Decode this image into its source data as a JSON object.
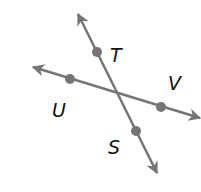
{
  "diagram": {
    "line_color": "#757575",
    "label_color": "#111111",
    "lines": [
      {
        "name": "line-TS",
        "from": [
          78,
          14
        ],
        "to": [
          157,
          173
        ]
      },
      {
        "name": "line-UV",
        "from": [
          33,
          67
        ],
        "to": [
          200,
          118
        ]
      }
    ],
    "points": [
      {
        "label": "T",
        "x": 97,
        "y": 52,
        "lx": 110,
        "ly": 62
      },
      {
        "label": "S",
        "x": 136,
        "y": 131,
        "lx": 108,
        "ly": 154
      },
      {
        "label": "U",
        "x": 70,
        "y": 79,
        "lx": 52,
        "ly": 117
      },
      {
        "label": "V",
        "x": 161,
        "y": 107,
        "lx": 168,
        "ly": 90
      }
    ]
  }
}
